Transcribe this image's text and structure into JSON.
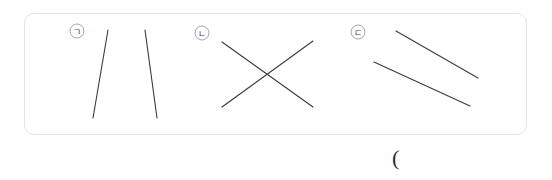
{
  "figure": {
    "panel": {
      "border_color": "#e3e3e3",
      "background_color": "#ffffff",
      "x": 24,
      "y": 13,
      "width": 503,
      "height": 122,
      "corner_radius": 10
    },
    "line_color": "#3a3a3a",
    "marker_stroke_color": "#8d8d8d",
    "caption": "(",
    "groups": [
      {
        "id": "group-a",
        "label": "ㄱ",
        "description": "two-lines-converging-upward",
        "marker": {
          "cx": 77,
          "cy": 31,
          "r": 7
        },
        "lines": [
          {
            "x1": 108,
            "y1": 30,
            "x2": 93,
            "y2": 118
          },
          {
            "x1": 145,
            "y1": 30,
            "x2": 157,
            "y2": 118
          }
        ]
      },
      {
        "id": "group-b",
        "label": "ㄴ",
        "description": "two-lines-crossing-x",
        "marker": {
          "cx": 202,
          "cy": 33,
          "r": 7
        },
        "lines": [
          {
            "x1": 222,
            "y1": 42,
            "x2": 313,
            "y2": 107
          },
          {
            "x1": 222,
            "y1": 107,
            "x2": 313,
            "y2": 41
          }
        ]
      },
      {
        "id": "group-c",
        "label": "ㄷ",
        "description": "two-parallel-lines",
        "marker": {
          "cx": 358,
          "cy": 32,
          "r": 7
        },
        "lines": [
          {
            "x1": 396,
            "y1": 31,
            "x2": 478,
            "y2": 78
          },
          {
            "x1": 374,
            "y1": 62,
            "x2": 470,
            "y2": 106
          }
        ]
      }
    ]
  }
}
